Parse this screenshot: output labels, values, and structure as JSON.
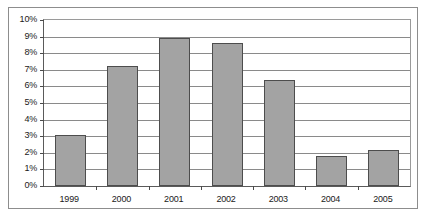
{
  "chart_data": {
    "type": "bar",
    "title": "",
    "xlabel": "",
    "ylabel": "",
    "categories": [
      "1999",
      "2000",
      "2001",
      "2002",
      "2003",
      "2004",
      "2005"
    ],
    "values": [
      3.1,
      7.2,
      8.9,
      8.6,
      6.4,
      1.8,
      2.15
    ],
    "ylim": [
      0,
      10
    ],
    "ytick_labels": [
      "10%",
      "9%",
      "8%",
      "7%",
      "6%",
      "5%",
      "4%",
      "3%",
      "2%",
      "1%",
      "0%"
    ],
    "ytick_values": [
      10,
      9,
      8,
      7,
      6,
      5,
      4,
      3,
      2,
      1,
      0
    ],
    "grid": true,
    "legend": false,
    "value_format": "percent",
    "bar_color": "#a3a3a3",
    "bar_border_color": "#4d4d4d",
    "gridline_color": "#8a8a8a",
    "axis_color": "#5a5a5a",
    "frame_color": "#8d8d8d",
    "background": "#ffffff"
  }
}
